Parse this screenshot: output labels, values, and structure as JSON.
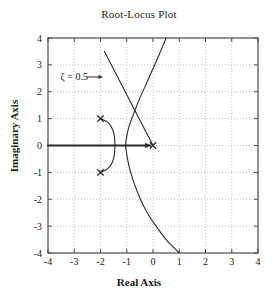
{
  "chart_data": {
    "type": "line",
    "title": "Root-Locus Plot",
    "xlabel": "Real Axis",
    "ylabel": "Imaginary Axis",
    "xlim": [
      -4,
      4
    ],
    "ylim": [
      -4,
      4
    ],
    "grid": true,
    "grid_style": "dotted",
    "legend": "none",
    "xticks": [
      -4,
      -3,
      -2,
      -1,
      0,
      1,
      2,
      3,
      4
    ],
    "xtick_labels": [
      "-4",
      "-3",
      "-2",
      "-1",
      "0",
      "1",
      "2",
      "3",
      "4"
    ],
    "yticks": [
      -4,
      -3,
      -2,
      -1,
      0,
      1,
      2,
      3,
      4
    ],
    "ytick_labels": [
      "-4",
      "-3",
      "-2",
      "-1",
      "0",
      "1",
      "2",
      "3",
      "4"
    ],
    "annotations": [
      {
        "name": "zeta-annotation",
        "text": "ζ = 0.5",
        "text_x": -3.0,
        "text_y": 2.55,
        "arrow_from_x": -2.55,
        "arrow_from_y": 2.55,
        "arrow_to_x": -1.9,
        "arrow_to_y": 2.55
      }
    ],
    "poles": [
      {
        "label": "pole-upper",
        "re": -2.0,
        "im": 1.0,
        "marker": "x"
      },
      {
        "label": "pole-lower",
        "re": -2.0,
        "im": -1.0,
        "marker": "x"
      },
      {
        "label": "pole-origin",
        "re": 0.0,
        "im": 0.0,
        "marker": "x"
      }
    ],
    "zeros": [],
    "series": [
      {
        "name": "real-axis-locus",
        "style": "thick-solid-with-arrow",
        "points": [
          [
            -4.0,
            0.0
          ],
          [
            -3.0,
            0.0
          ],
          [
            -2.0,
            0.0
          ],
          [
            -1.0,
            0.0
          ],
          [
            -0.1,
            0.0
          ]
        ]
      },
      {
        "name": "complex-pole-arc",
        "style": "solid",
        "points": [
          [
            -2.0,
            1.0
          ],
          [
            -1.72,
            0.86
          ],
          [
            -1.55,
            0.62
          ],
          [
            -1.47,
            0.34
          ],
          [
            -1.45,
            0.0
          ],
          [
            -1.47,
            -0.34
          ],
          [
            -1.55,
            -0.62
          ],
          [
            -1.72,
            -0.86
          ],
          [
            -2.0,
            -1.0
          ]
        ]
      },
      {
        "name": "upward-branch",
        "style": "solid",
        "points": [
          [
            -1.05,
            0.0
          ],
          [
            -1.0,
            0.35
          ],
          [
            -0.9,
            0.75
          ],
          [
            -0.75,
            1.15
          ],
          [
            -0.55,
            1.65
          ],
          [
            -0.3,
            2.2
          ],
          [
            -0.05,
            2.75
          ],
          [
            0.2,
            3.3
          ],
          [
            0.5,
            4.0
          ]
        ]
      },
      {
        "name": "downward-branch",
        "style": "solid",
        "points": [
          [
            -1.05,
            0.0
          ],
          [
            -0.98,
            -0.45
          ],
          [
            -0.88,
            -0.9
          ],
          [
            -0.72,
            -1.4
          ],
          [
            -0.5,
            -1.95
          ],
          [
            -0.22,
            -2.5
          ],
          [
            0.12,
            -3.0
          ],
          [
            0.5,
            -3.5
          ],
          [
            1.0,
            -4.0
          ]
        ]
      },
      {
        "name": "zeta-damping-line",
        "style": "solid",
        "points": [
          [
            -1.85,
            3.5
          ],
          [
            0.0,
            0.0
          ]
        ]
      }
    ]
  },
  "colors": {
    "axis": "#4a4a4a",
    "grid": "#b4b4b4",
    "curve": "#2a2a2a",
    "text": "#1a1a1a",
    "background": "#ffffff"
  }
}
